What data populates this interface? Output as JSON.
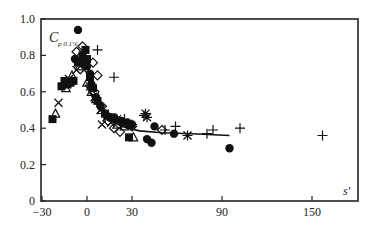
{
  "chart_data": {
    "type": "scatter",
    "title": "",
    "xlabel": "s'",
    "ylabel": "C_p 0.1%",
    "ylabel_main": "C",
    "ylabel_sub": "p 0.1%",
    "xlim": [
      -30,
      170
    ],
    "ylim": [
      0,
      1.0
    ],
    "x_ticks": [
      -30,
      0,
      30,
      90,
      150
    ],
    "x_tick_labels": [
      "-30",
      "0",
      "30",
      "90",
      "150"
    ],
    "y_ticks": [
      0,
      0.2,
      0.4,
      0.6,
      0.8,
      1.0
    ],
    "y_tick_labels": [
      "0",
      "0.2",
      "0.4",
      "0.6",
      "0.8",
      "1.0"
    ],
    "grid": false,
    "legend": null,
    "series": [
      {
        "name": "filled-circle",
        "marker": "circle-filled",
        "points": [
          [
            -6,
            0.94
          ],
          [
            -8,
            0.78
          ],
          [
            -3,
            0.76
          ],
          [
            0,
            0.74
          ],
          [
            2,
            0.7
          ],
          [
            3,
            0.64
          ],
          [
            6,
            0.57
          ],
          [
            9,
            0.52
          ],
          [
            12,
            0.48
          ],
          [
            15,
            0.46
          ],
          [
            19,
            0.45
          ],
          [
            23,
            0.44
          ],
          [
            27,
            0.43
          ],
          [
            30,
            0.42
          ],
          [
            45,
            0.41
          ],
          [
            40,
            0.34
          ],
          [
            43,
            0.32
          ],
          [
            58,
            0.37
          ],
          [
            95,
            0.29
          ]
        ]
      },
      {
        "name": "filled-square",
        "marker": "square-filled",
        "points": [
          [
            -23,
            0.45
          ],
          [
            -17,
            0.63
          ],
          [
            -15,
            0.66
          ],
          [
            -13,
            0.64
          ],
          [
            -11,
            0.65
          ],
          [
            -9,
            0.66
          ],
          [
            -6,
            0.76
          ],
          [
            -3,
            0.8
          ],
          [
            -1,
            0.83
          ],
          [
            0,
            0.78
          ],
          [
            2,
            0.68
          ],
          [
            4,
            0.62
          ],
          [
            7,
            0.55
          ],
          [
            12,
            0.48
          ],
          [
            17,
            0.46
          ],
          [
            28,
            0.35
          ]
        ]
      },
      {
        "name": "open-triangle",
        "marker": "triangle-open",
        "points": [
          [
            -21,
            0.48
          ],
          [
            -14,
            0.62
          ],
          [
            -10,
            0.69
          ],
          [
            -5,
            0.74
          ],
          [
            0,
            0.65
          ],
          [
            3,
            0.6
          ],
          [
            6,
            0.56
          ],
          [
            10,
            0.5
          ],
          [
            14,
            0.47
          ],
          [
            20,
            0.42
          ],
          [
            25,
            0.41
          ],
          [
            31,
            0.35
          ]
        ]
      },
      {
        "name": "open-diamond",
        "marker": "diamond-open",
        "points": [
          [
            -7,
            0.82
          ],
          [
            -3,
            0.85
          ],
          [
            4,
            0.76
          ],
          [
            7,
            0.69
          ],
          [
            5,
            0.6
          ],
          [
            10,
            0.52
          ],
          [
            14,
            0.44
          ],
          [
            18,
            0.4
          ],
          [
            22,
            0.38
          ],
          [
            30,
            0.41
          ],
          [
            50,
            0.39
          ]
        ]
      },
      {
        "name": "cross-x",
        "marker": "x",
        "points": [
          [
            -19,
            0.54
          ],
          [
            -12,
            0.67
          ],
          [
            -7,
            0.72
          ],
          [
            -2,
            0.72
          ],
          [
            2,
            0.63
          ],
          [
            5,
            0.57
          ],
          [
            9,
            0.5
          ],
          [
            13,
            0.46
          ],
          [
            10,
            0.42
          ],
          [
            16,
            0.43
          ],
          [
            24,
            0.42
          ]
        ]
      },
      {
        "name": "plus",
        "marker": "plus",
        "points": [
          [
            7,
            0.83
          ],
          [
            18,
            0.68
          ],
          [
            25,
            0.45
          ],
          [
            38,
            0.47
          ],
          [
            59,
            0.41
          ],
          [
            84,
            0.39
          ],
          [
            102,
            0.4
          ],
          [
            157,
            0.36
          ],
          [
            30,
            0.42
          ],
          [
            80,
            0.37
          ],
          [
            52,
            0.39
          ]
        ]
      },
      {
        "name": "asterisk",
        "marker": "asterisk",
        "points": [
          [
            39,
            0.48
          ],
          [
            40,
            0.46
          ],
          [
            67,
            0.36
          ],
          [
            20,
            0.45
          ]
        ]
      }
    ],
    "fit_line": {
      "name": "fitted-curve",
      "points": [
        [
          -1,
          0.64
        ],
        [
          3,
          0.58
        ],
        [
          8,
          0.51
        ],
        [
          13,
          0.46
        ],
        [
          18,
          0.43
        ],
        [
          25,
          0.405
        ],
        [
          35,
          0.385
        ],
        [
          50,
          0.375
        ],
        [
          70,
          0.37
        ],
        [
          95,
          0.36
        ]
      ]
    }
  },
  "labels": {
    "xlabel": "s'",
    "ylabel_main": "C",
    "ylabel_sub": "p 0.1%"
  }
}
